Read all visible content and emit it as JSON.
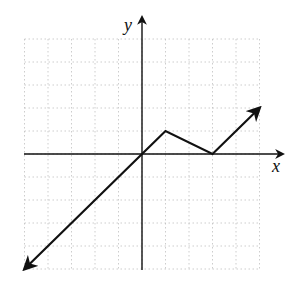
{
  "chart_data": {
    "type": "line",
    "title": "",
    "xlabel": "x",
    "ylabel": "y",
    "xlim": [
      -5,
      5
    ],
    "ylim": [
      -5,
      5
    ],
    "grid": true,
    "grid_step": 1,
    "tick_labels": false,
    "series": [
      {
        "name": "piecewise linear function",
        "x": [
          -5,
          0,
          1,
          3,
          5
        ],
        "y": [
          -5,
          0,
          1,
          0,
          2
        ],
        "arrow_start": true,
        "arrow_end": true
      }
    ]
  },
  "colors": {
    "line": "#111111",
    "axis": "#111111",
    "grid": "#b8b8b8"
  }
}
